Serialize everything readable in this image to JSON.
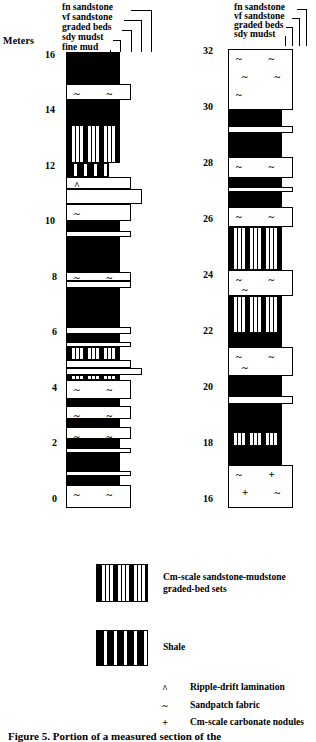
{
  "axis": {
    "units_label": "Meters",
    "left_ticks": [
      "16",
      "14",
      "12",
      "10",
      "8",
      "6",
      "4",
      "2",
      "0"
    ],
    "right_ticks": [
      "32",
      "30",
      "28",
      "26",
      "24",
      "22",
      "20",
      "18",
      "16"
    ]
  },
  "grain_headers": {
    "left": [
      "fn sandstone",
      "vf sandstone",
      "graded beds",
      "sdy mudst",
      "fine mud"
    ],
    "right": [
      "fn sandstone",
      "vf sandstone",
      "graded beds",
      "sdy mudst"
    ]
  },
  "legend": {
    "items": [
      {
        "symbol": "graded-box",
        "label_line1": "Cm-scale sandstone-mudstone",
        "label_line2": "graded-bed sets"
      },
      {
        "symbol": "shale-box",
        "label_line1": "Shale",
        "label_line2": ""
      }
    ],
    "symbols": [
      {
        "glyph": "^",
        "label": "Ripple-drift lamination"
      },
      {
        "glyph": "~",
        "label": "Sandpatch fabric"
      },
      {
        "glyph": "+",
        "label": "Cm-scale carbonate nodules"
      }
    ]
  },
  "caption": "Figure 5.   Portion of a measured section of the",
  "colors": {
    "ink": "#000000",
    "paper": "#ffffff"
  },
  "chart_data": {
    "type": "stratigraphic-column",
    "title": "Portion of a measured section",
    "ylabel": "Meters",
    "xlabel": "grain size",
    "grain_size_classes": [
      "fine mud",
      "sdy mudst",
      "graded beds",
      "vf sandstone",
      "fn sandstone"
    ],
    "columns": [
      {
        "name": "left-column",
        "ylim": [
          0,
          16.6
        ],
        "beds": [
          {
            "top": 16.6,
            "base": 15.45,
            "width": 4,
            "fill": "black",
            "symbols": []
          },
          {
            "top": 15.45,
            "base": 14.85,
            "width": 5,
            "fill": "white",
            "symbols": [
              "~",
              "~"
            ]
          },
          {
            "top": 14.85,
            "base": 13.95,
            "width": 4,
            "fill": "black",
            "symbols": []
          },
          {
            "top": 13.95,
            "base": 12.55,
            "width": 4,
            "fill": "graded",
            "symbols": []
          },
          {
            "top": 12.55,
            "base": 12.05,
            "width": 3,
            "fill": "shale",
            "symbols": []
          },
          {
            "top": 12.05,
            "base": 11.6,
            "width": 5,
            "fill": "white",
            "symbols": [
              "^"
            ]
          },
          {
            "top": 11.6,
            "base": 11.05,
            "width": 6,
            "fill": "white",
            "symbols": []
          },
          {
            "top": 11.05,
            "base": 10.45,
            "width": 5,
            "fill": "white",
            "symbols": [
              "~"
            ]
          },
          {
            "top": 10.45,
            "base": 10.1,
            "width": 4,
            "fill": "black",
            "symbols": []
          },
          {
            "top": 10.1,
            "base": 9.85,
            "width": 5,
            "fill": "white",
            "symbols": []
          },
          {
            "top": 9.85,
            "base": 8.6,
            "width": 4,
            "fill": "black",
            "symbols": []
          },
          {
            "top": 8.6,
            "base": 8.25,
            "width": 5,
            "fill": "white",
            "symbols": [
              "~",
              "~"
            ]
          },
          {
            "top": 8.25,
            "base": 8.0,
            "width": 5,
            "fill": "white",
            "symbols": []
          },
          {
            "top": 8.0,
            "base": 6.6,
            "width": 4,
            "fill": "black",
            "symbols": []
          },
          {
            "top": 6.6,
            "base": 6.35,
            "width": 5,
            "fill": "white",
            "symbols": []
          },
          {
            "top": 6.35,
            "base": 6.05,
            "width": 4,
            "fill": "black",
            "symbols": []
          },
          {
            "top": 6.05,
            "base": 5.85,
            "width": 5,
            "fill": "white",
            "symbols": []
          },
          {
            "top": 5.85,
            "base": 5.4,
            "width": 4,
            "fill": "graded",
            "symbols": []
          },
          {
            "top": 5.4,
            "base": 5.1,
            "width": 5,
            "fill": "white",
            "symbols": []
          },
          {
            "top": 5.1,
            "base": 4.85,
            "width": 6,
            "fill": "white",
            "symbols": []
          },
          {
            "top": 4.85,
            "base": 4.65,
            "width": 4,
            "fill": "graded",
            "symbols": []
          },
          {
            "top": 4.65,
            "base": 3.95,
            "width": 5,
            "fill": "white",
            "symbols": [
              "~",
              "~",
              "~"
            ]
          },
          {
            "top": 3.95,
            "base": 3.7,
            "width": 4,
            "fill": "black",
            "symbols": []
          },
          {
            "top": 3.7,
            "base": 3.25,
            "width": 5,
            "fill": "white",
            "symbols": [
              "~",
              "~"
            ]
          },
          {
            "top": 3.25,
            "base": 2.95,
            "width": 4,
            "fill": "black",
            "symbols": []
          },
          {
            "top": 2.95,
            "base": 2.5,
            "width": 5,
            "fill": "white",
            "symbols": [
              "~",
              "~"
            ]
          },
          {
            "top": 2.5,
            "base": 2.2,
            "width": 4,
            "fill": "black",
            "symbols": []
          },
          {
            "top": 2.2,
            "base": 2.0,
            "width": 5,
            "fill": "white",
            "symbols": []
          },
          {
            "top": 2.0,
            "base": 1.35,
            "width": 4,
            "fill": "black",
            "symbols": []
          },
          {
            "top": 1.35,
            "base": 1.15,
            "width": 5,
            "fill": "white",
            "symbols": []
          },
          {
            "top": 1.15,
            "base": 0.85,
            "width": 4,
            "fill": "black",
            "symbols": []
          },
          {
            "top": 0.85,
            "base": 0.0,
            "width": 5,
            "fill": "white",
            "symbols": [
              "~",
              "~"
            ]
          }
        ]
      },
      {
        "name": "right-column",
        "ylim": [
          16,
          32.6
        ],
        "beds": [
          {
            "top": 32.55,
            "base": 30.35,
            "width": 5,
            "fill": "white",
            "symbols": [
              "~",
              "~",
              "~",
              "~",
              "~"
            ]
          },
          {
            "top": 30.35,
            "base": 29.8,
            "width": 4,
            "fill": "black",
            "symbols": []
          },
          {
            "top": 29.8,
            "base": 29.55,
            "width": 5,
            "fill": "white",
            "symbols": []
          },
          {
            "top": 29.55,
            "base": 28.65,
            "width": 4,
            "fill": "black",
            "symbols": []
          },
          {
            "top": 28.65,
            "base": 27.9,
            "width": 5,
            "fill": "white",
            "symbols": [
              "~",
              "~"
            ]
          },
          {
            "top": 27.9,
            "base": 27.6,
            "width": 4,
            "fill": "black",
            "symbols": []
          },
          {
            "top": 27.6,
            "base": 27.4,
            "width": 5,
            "fill": "white",
            "symbols": []
          },
          {
            "top": 27.4,
            "base": 26.85,
            "width": 4,
            "fill": "black",
            "symbols": []
          },
          {
            "top": 26.85,
            "base": 26.15,
            "width": 5,
            "fill": "white",
            "symbols": [
              "~",
              "~"
            ]
          },
          {
            "top": 26.15,
            "base": 24.6,
            "width": 4,
            "fill": "graded",
            "symbols": []
          },
          {
            "top": 24.6,
            "base": 23.65,
            "width": 5,
            "fill": "white",
            "symbols": [
              "~",
              "~",
              "~"
            ]
          },
          {
            "top": 23.65,
            "base": 22.3,
            "width": 4,
            "fill": "graded",
            "symbols": []
          },
          {
            "top": 22.3,
            "base": 21.8,
            "width": 4,
            "fill": "black",
            "symbols": []
          },
          {
            "top": 21.8,
            "base": 20.75,
            "width": 5,
            "fill": "white",
            "symbols": [
              "~",
              "~",
              "~"
            ]
          },
          {
            "top": 20.75,
            "base": 20.35,
            "width": 4,
            "fill": "black",
            "symbols": []
          },
          {
            "top": 20.35,
            "base": 20.05,
            "width": 4,
            "fill": "black",
            "symbols": []
          },
          {
            "top": 20.05,
            "base": 19.75,
            "width": 5,
            "fill": "white",
            "symbols": []
          },
          {
            "top": 19.75,
            "base": 18.75,
            "width": 4,
            "fill": "black",
            "symbols": []
          },
          {
            "top": 18.75,
            "base": 18.25,
            "width": 4,
            "fill": "graded",
            "symbols": []
          },
          {
            "top": 18.25,
            "base": 17.55,
            "width": 4,
            "fill": "black",
            "symbols": []
          },
          {
            "top": 17.55,
            "base": 16.0,
            "width": 5,
            "fill": "white",
            "symbols": [
              "~",
              "+",
              "+",
              "~"
            ]
          }
        ]
      }
    ]
  }
}
